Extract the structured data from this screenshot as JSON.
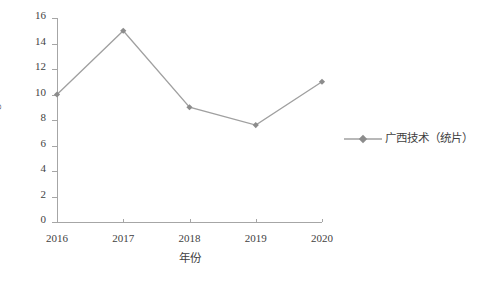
{
  "chart_data": {
    "type": "line",
    "title": "",
    "xlabel": "年份",
    "ylabel_prefix": "单价（元·kg",
    "ylabel_sup": "-1",
    "ylabel_suffix": "）",
    "ylabel_full": "单价（元·kg-1）",
    "categories": [
      "2016",
      "2017",
      "2018",
      "2019",
      "2020"
    ],
    "values": [
      10,
      15,
      9,
      7.6,
      11
    ],
    "series": [
      {
        "name": "广西技术（统片）",
        "values": [
          10,
          15,
          9,
          7.6,
          11
        ]
      }
    ],
    "ylim": [
      0,
      16
    ],
    "ystep": 2,
    "yticks": [
      "16",
      "14",
      "12",
      "10",
      "8",
      "6",
      "4",
      "2",
      "0"
    ],
    "grid": false,
    "legend_position": "right",
    "marker": "diamond",
    "line_color": "#a0a0a0",
    "marker_color": "#8c8c8c",
    "axis_color": "#a6a6a6",
    "text_color": "#3f3f3f"
  },
  "legend": {
    "entries": [
      {
        "label": "广西技术（统片）"
      }
    ]
  }
}
